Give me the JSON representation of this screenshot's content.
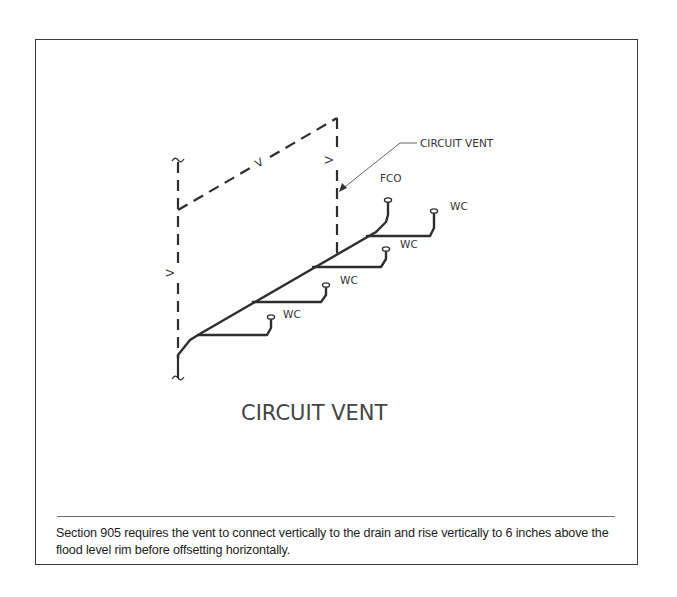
{
  "figure": {
    "title": "CIRCUIT VENT",
    "callout_label": "CIRCUIT VENT",
    "vent_labels": {
      "left_vertical": "V",
      "top_horizontal": "V",
      "right_vertical": "V"
    },
    "fixtures": [
      {
        "label": "WC"
      },
      {
        "label": "WC"
      },
      {
        "label": "WC"
      },
      {
        "label": "WC"
      }
    ],
    "cleanout_label": "FCO"
  },
  "caption": {
    "text": "Section 905 requires the vent to connect vertically to the drain and rise vertically to 6 inches above the flood level rim before offsetting horizontally."
  },
  "colors": {
    "drain_line": "#2e2e2e",
    "vent_line": "#2e2e2e",
    "title_text": "#444444",
    "frame": "#3a3a3a"
  }
}
